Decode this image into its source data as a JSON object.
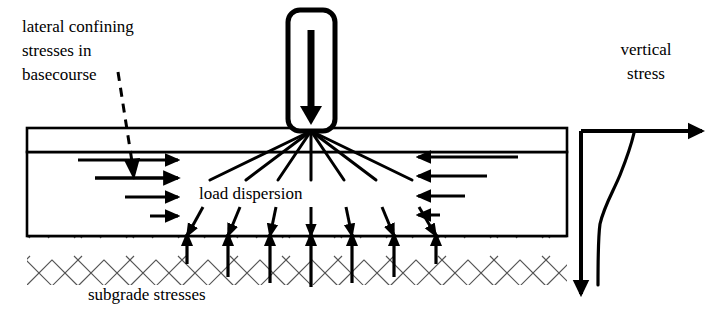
{
  "figure": {
    "title_alt": "Pavement structure load dispersion and stress distribution diagram",
    "background_color": "#ffffff",
    "ink_color": "#000000",
    "hatch_color": "#555555",
    "width": 715,
    "height": 319
  },
  "labels": {
    "lateral_confining": {
      "line1": "lateral confining",
      "line2": "stresses in",
      "line3": "basecourse",
      "x": 22,
      "y": 32
    },
    "load_dispersion": {
      "text": "load dispersion",
      "x": 199,
      "y": 199
    },
    "subgrade_stresses": {
      "text": "subgrade stresses",
      "x": 88,
      "y": 300
    },
    "vertical_stress": {
      "line1": "vertical",
      "line2": "stress",
      "x": 646,
      "y": 55
    }
  },
  "load_block": {
    "name": "wheel-load-block",
    "x": 288,
    "y": 10,
    "width": 47,
    "height": 121,
    "corner_radius": 12,
    "border_width": 5,
    "fill": "#ffffff",
    "arrow_direction": "down",
    "arrow_x": 311,
    "arrow_top_y": 30,
    "arrow_bottom_y": 115
  },
  "pavement": {
    "left_x": 27,
    "right_x": 567,
    "surface_layer": {
      "name": "surface-layer",
      "top_y": 128,
      "bottom_y": 152,
      "fill": "#ffffff",
      "stroke_width": 2.5
    },
    "basecourse_layer": {
      "name": "basecourse-layer",
      "top_y": 152,
      "bottom_y": 236,
      "fill": "#ffffff",
      "stroke_width": 2.5
    },
    "subgrade": {
      "name": "subgrade-layer",
      "top_y": 236,
      "bottom_y": 285,
      "hatch_pattern": "herringbone",
      "hatch_spacing": 26
    }
  },
  "lateral_arrows_left": {
    "direction": "right",
    "arrows": [
      {
        "x_start": 78,
        "x_end": 178,
        "y": 160,
        "stroke_width": 3.0
      },
      {
        "x_start": 95,
        "x_end": 178,
        "y": 178,
        "stroke_width": 3.4
      },
      {
        "x_start": 125,
        "x_end": 178,
        "y": 197,
        "stroke_width": 3.0
      },
      {
        "x_start": 150,
        "x_end": 178,
        "y": 216,
        "stroke_width": 3.0
      }
    ]
  },
  "lateral_arrows_right": {
    "direction": "left",
    "arrows": [
      {
        "x_start": 518,
        "x_end": 418,
        "y": 157,
        "stroke_width": 3.0
      },
      {
        "x_start": 487,
        "x_end": 418,
        "y": 176,
        "stroke_width": 3.0
      },
      {
        "x_start": 465,
        "x_end": 418,
        "y": 196,
        "stroke_width": 3.0
      },
      {
        "x_start": 440,
        "x_end": 418,
        "y": 215,
        "stroke_width": 3.0
      }
    ]
  },
  "dashed_pointer": {
    "name": "dashed-callout-arrow",
    "x_start": 118,
    "y_start": 72,
    "x_end": 133,
    "y_end": 170,
    "dash_pattern": "9 7",
    "stroke_width": 3.0
  },
  "load_dispersion_fan": {
    "origin_x": 311,
    "origin_y": 131,
    "upper_end_y": 180,
    "lower_start_y": 208,
    "lower_end_y": 236,
    "stroke_width": 3.0,
    "rays": [
      {
        "angle_deg": -62,
        "upper_x": 210,
        "lower_x": 186
      },
      {
        "angle_deg": -42,
        "upper_x": 246,
        "lower_x": 228
      },
      {
        "angle_deg": -21,
        "upper_x": 278,
        "lower_x": 270
      },
      {
        "angle_deg": 0,
        "upper_x": 311,
        "lower_x": 311
      },
      {
        "angle_deg": 21,
        "upper_x": 344,
        "lower_x": 352
      },
      {
        "angle_deg": 42,
        "upper_x": 376,
        "lower_x": 394
      },
      {
        "angle_deg": 62,
        "upper_x": 412,
        "lower_x": 436
      }
    ]
  },
  "subgrade_reaction_arrows": {
    "direction": "up",
    "base_y": 236,
    "stroke_width": 3.2,
    "arrows": [
      {
        "x": 187,
        "length": 28
      },
      {
        "x": 228,
        "length": 40
      },
      {
        "x": 270,
        "length": 46
      },
      {
        "x": 311,
        "length": 50
      },
      {
        "x": 352,
        "length": 46
      },
      {
        "x": 394,
        "length": 40
      },
      {
        "x": 436,
        "length": 28
      }
    ]
  },
  "stress_plot": {
    "name": "vertical-stress-plot",
    "axis_origin_x": 581,
    "axis_top_y": 131,
    "axis_bottom_y": 300,
    "axis_right_x": 708,
    "axis_stroke_width": 4.0,
    "horizontal_axis_label": "vertical stress",
    "curve": {
      "stroke_width": 3.0,
      "points": [
        {
          "x": 634,
          "y": 133
        },
        {
          "x": 629,
          "y": 152
        },
        {
          "x": 621,
          "y": 172
        },
        {
          "x": 612,
          "y": 194
        },
        {
          "x": 603,
          "y": 216
        },
        {
          "x": 599,
          "y": 238
        },
        {
          "x": 598,
          "y": 262
        },
        {
          "x": 598,
          "y": 285
        }
      ]
    }
  }
}
